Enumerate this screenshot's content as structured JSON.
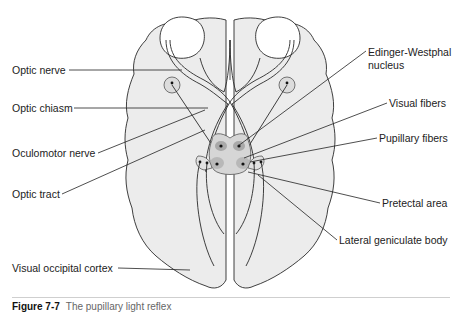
{
  "figure": {
    "type": "anatomical-diagram",
    "caption_number": "Figure 7-7",
    "caption_text": "The pupillary light reflex"
  },
  "labels": {
    "left": [
      {
        "id": "optic-nerve",
        "text": "Optic nerve"
      },
      {
        "id": "optic-chiasm",
        "text": "Optic chiasm"
      },
      {
        "id": "oculomotor-nerve",
        "text": "Oculomotor nerve"
      },
      {
        "id": "optic-tract",
        "text": "Optic tract"
      },
      {
        "id": "visual-occipital-cortex",
        "text": "Visual occipital cortex"
      }
    ],
    "right": [
      {
        "id": "edinger-westphal",
        "text": "Edinger-Westphal",
        "text2": "nucleus"
      },
      {
        "id": "visual-fibers",
        "text": "Visual fibers"
      },
      {
        "id": "pupillary-fibers",
        "text": "Pupillary fibers"
      },
      {
        "id": "pretectal-area",
        "text": "Pretectal area"
      },
      {
        "id": "lateral-geniculate-body",
        "text": "Lateral geniculate body"
      }
    ]
  },
  "colors": {
    "brain_fill": "#ececec",
    "outline": "#2a2a2a",
    "nucleus_fill": "#c8c8c8",
    "nucleus_dark": "#a9a9a9"
  }
}
